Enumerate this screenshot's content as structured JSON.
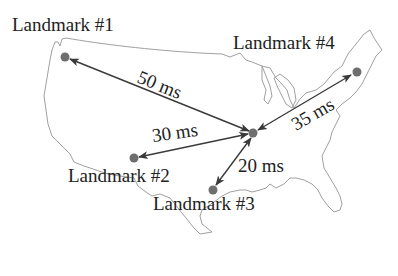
{
  "diagram": {
    "colors": {
      "map_outline": "#9a9a9a",
      "arrow": "#3a3a3a",
      "dot": "#6e6e6e",
      "text": "#222222"
    },
    "target": {
      "name": "target",
      "label": ""
    },
    "landmarks": [
      {
        "id": 1,
        "label": "Landmark #1",
        "latency": "50 ms"
      },
      {
        "id": 2,
        "label": "Landmark #2",
        "latency": "30 ms"
      },
      {
        "id": 3,
        "label": "Landmark #3",
        "latency": "20 ms"
      },
      {
        "id": 4,
        "label": "Landmark #4",
        "latency": "35 ms"
      }
    ]
  }
}
